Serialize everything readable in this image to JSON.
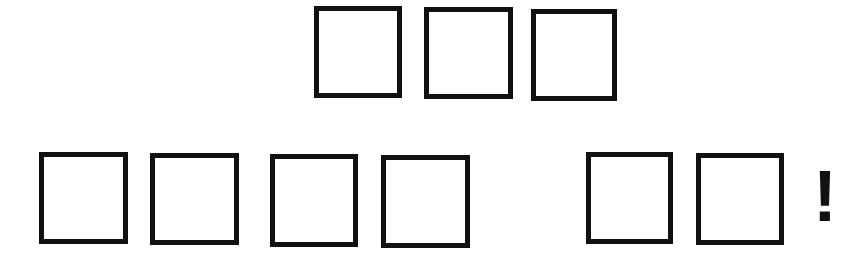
{
  "puzzle": {
    "rows": [
      {
        "name": "top-row",
        "words": [
          {
            "name": "word-1",
            "boxes": [
              {
                "x": 314,
                "y": 6,
                "w": 88,
                "h": 92,
                "value": ""
              },
              {
                "x": 424,
                "y": 7,
                "w": 89,
                "h": 92,
                "value": ""
              },
              {
                "x": 531,
                "y": 9,
                "w": 86,
                "h": 92,
                "value": ""
              }
            ]
          }
        ]
      },
      {
        "name": "bottom-row",
        "words": [
          {
            "name": "word-2",
            "boxes": [
              {
                "x": 39,
                "y": 152,
                "w": 89,
                "h": 92,
                "value": ""
              },
              {
                "x": 150,
                "y": 153,
                "w": 89,
                "h": 92,
                "value": ""
              },
              {
                "x": 270,
                "y": 154,
                "w": 88,
                "h": 93,
                "value": ""
              },
              {
                "x": 381,
                "y": 155,
                "w": 89,
                "h": 93,
                "value": ""
              }
            ]
          },
          {
            "name": "word-3",
            "boxes": [
              {
                "x": 586,
                "y": 152,
                "w": 87,
                "h": 92,
                "value": ""
              },
              {
                "x": 696,
                "y": 153,
                "w": 88,
                "h": 92,
                "value": ""
              }
            ]
          }
        ]
      }
    ],
    "punctuation": {
      "text": "!",
      "x": 813,
      "y": 160,
      "size": 72
    },
    "colors": {
      "border": "#111111",
      "background": "#ffffff"
    }
  }
}
